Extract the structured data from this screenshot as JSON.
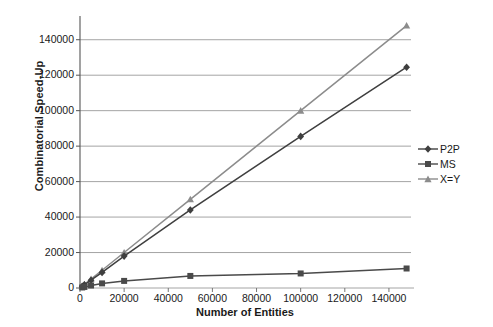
{
  "chart_data": {
    "type": "line",
    "title": "",
    "xlabel": "Number of Entities",
    "ylabel": "Combinatorial Speed-Up",
    "xlim": [
      0,
      150000
    ],
    "ylim": [
      0,
      150000
    ],
    "xticks": [
      "0",
      "20000",
      "40000",
      "60000",
      "80000",
      "100000",
      "120000",
      "140000"
    ],
    "xtick_values": [
      0,
      20000,
      40000,
      60000,
      80000,
      100000,
      120000,
      140000
    ],
    "yticks": [
      "0",
      "20000",
      "40000",
      "60000",
      "80000",
      "100000",
      "120000",
      "140000"
    ],
    "ytick_values": [
      0,
      20000,
      40000,
      60000,
      80000,
      100000,
      120000,
      140000
    ],
    "grid": "horizontal",
    "legend_position": "right",
    "series": [
      {
        "name": "P2P",
        "color": "#3f3f3f",
        "marker": "diamond",
        "x": [
          1000,
          2000,
          5000,
          10000,
          20000,
          50000,
          100000,
          148000
        ],
        "values": [
          900,
          1800,
          4400,
          8800,
          18000,
          44000,
          85500,
          124500
        ]
      },
      {
        "name": "MS",
        "color": "#4a4a4a",
        "marker": "square",
        "x": [
          1000,
          2000,
          5000,
          10000,
          20000,
          50000,
          100000,
          148000
        ],
        "values": [
          300,
          600,
          1400,
          2600,
          4000,
          6800,
          8200,
          11000
        ]
      },
      {
        "name": "X=Y",
        "color": "#8c8c8c",
        "marker": "triangle",
        "x": [
          1000,
          2000,
          5000,
          10000,
          20000,
          50000,
          100000,
          148000
        ],
        "values": [
          1000,
          2000,
          5000,
          10000,
          20000,
          50000,
          100000,
          148000
        ]
      }
    ]
  },
  "legend": {
    "items": [
      {
        "label": "P2P"
      },
      {
        "label": "MS"
      },
      {
        "label": "X=Y"
      }
    ]
  },
  "axes": {
    "x_title": "Number of Entities",
    "y_title": "Combinatorial Speed-Up"
  }
}
